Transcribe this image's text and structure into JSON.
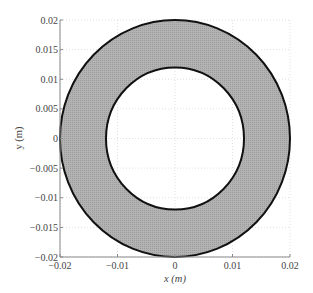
{
  "chart_data": {
    "type": "area",
    "title": "",
    "xlabel": "x (m)",
    "ylabel": "y (m)",
    "xlim": [
      -0.02,
      0.02
    ],
    "ylim": [
      -0.02,
      0.02
    ],
    "grid": true,
    "legend": null,
    "x_ticks": [
      "-0.02",
      "-0.01",
      "0",
      "0.01",
      "0.02"
    ],
    "y_ticks": [
      "-0.02",
      "-0.015",
      "-0.01",
      "-0.005",
      "0",
      "0.005",
      "0.01",
      "0.015",
      "0.02"
    ],
    "shapes": [
      {
        "name": "annulus",
        "center": [
          0,
          0
        ],
        "outer_radius": 0.02,
        "inner_radius": 0.012,
        "fill": "#a9a9a9",
        "edge": "#111111"
      }
    ]
  },
  "colors": {
    "ring_fill": "#a9a9a9",
    "ring_edge": "#111111",
    "grid": "#d8d8d8",
    "axis": "#888888"
  }
}
